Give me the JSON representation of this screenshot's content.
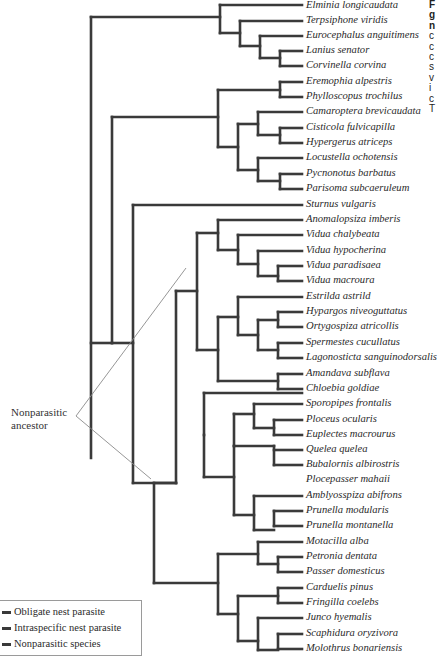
{
  "figure": {
    "type": "phylogenetic-tree",
    "leaves": [
      "Elminia longicaudata",
      "Terpsiphone viridis",
      "Eurocephalus anguitimens",
      "Lanius senator",
      "Corvinella corvina",
      "Eremophia alpestris",
      "Phylloscopus trochilus",
      "Camaroptera brevicaudata",
      "Cisticola fulvicapilla",
      "Hypergerus atriceps",
      "Locustella ochotensis",
      "Pycnonotus barbatus",
      "Parisoma subcaeruleum",
      "Sturnus vulgaris",
      "Anomalopsiza imberis",
      "Vidua chalybeata",
      "Vidua hypocherina",
      "Vidua paradisaea",
      "Vidua macroura",
      "Estrilda astrild",
      "Hypargos niveoguttatus",
      "Ortygospiza atricollis",
      "Spermestes cucullatus",
      "Lagonosticta sanguinodorsalis",
      "Amandava subflava",
      "Chloebia goldiae",
      "Sporopipes frontalis",
      "Ploceus ocularis",
      "Euplectes macrourus",
      "Quelea quelea",
      "Bubalornis albirostris",
      "Plocepasser mahaii",
      "Amblyosspiza abifrons",
      "Prunella modularis",
      "Prunella montanella",
      "Motacilla alba",
      "Petronia dentata",
      "Passer domesticus",
      "Carduelis pinus",
      "Fringilla coelebs",
      "Junco hyemalis",
      "Scaphidura oryzivora",
      "Molothrus bonariensis"
    ],
    "callout": {
      "line1": "Nonparasitic",
      "line2": "ancestor"
    },
    "legend": [
      {
        "label": "Obligate nest parasite"
      },
      {
        "label": "Intraspecific nest parasite"
      },
      {
        "label": "Nonparasitic species"
      }
    ],
    "colors": {
      "branch": "#3a3a3a",
      "callout_line": "#8a8a8a",
      "text": "#2a2a2a"
    },
    "cutoff_column_letters": [
      "F",
      "g",
      "n",
      "c",
      "c",
      "c",
      "s",
      "v",
      "i",
      "c",
      "T"
    ]
  }
}
